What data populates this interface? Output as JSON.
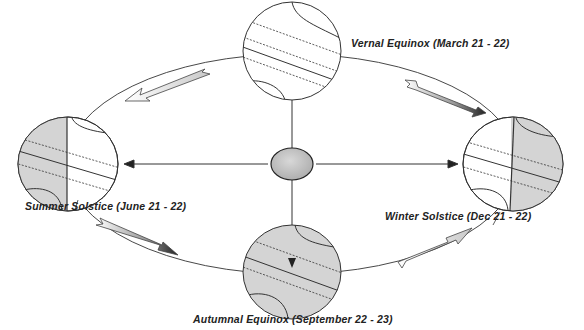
{
  "diagram": {
    "center_body": "sun",
    "positions": [
      {
        "id": "vernal",
        "label": "Vernal Equinox (March 21 - 22)",
        "shading": "none"
      },
      {
        "id": "summer",
        "label": "Summer Solstice (June 21 - 22)",
        "shading": "left-half"
      },
      {
        "id": "winter",
        "label": "Winter Solstice (Dec 21 - 22)",
        "shading": "right-half"
      },
      {
        "id": "autumnal",
        "label": "Autumnal Equinox (September 22 - 23)",
        "shading": "full"
      }
    ],
    "orbit_direction": "counter-clockwise",
    "colors": {
      "line": "#333333",
      "shade": "#d4d4d4",
      "sun": "#bdbdbd",
      "background": "#ffffff"
    }
  }
}
